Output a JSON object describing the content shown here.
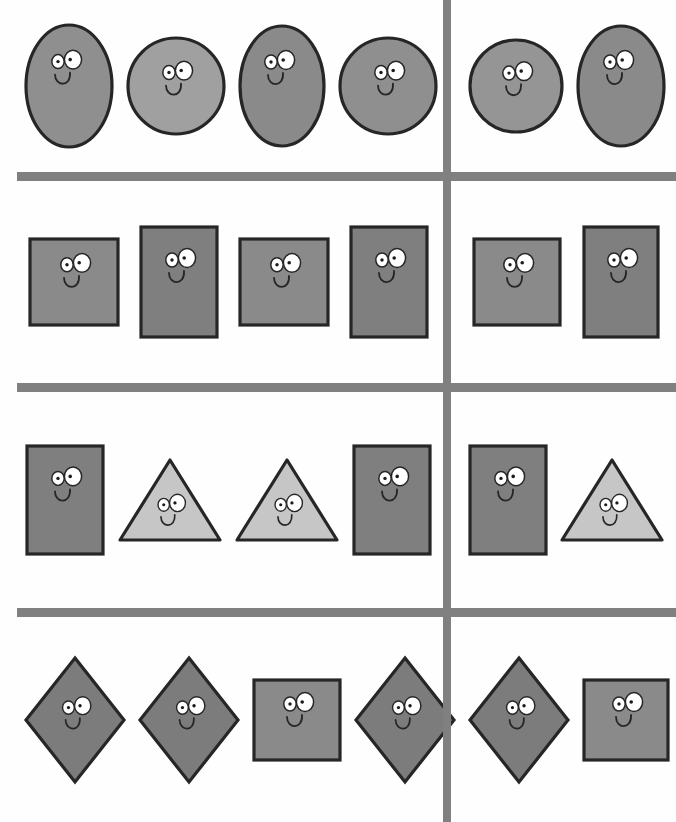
{
  "page": {
    "width": 676,
    "height": 822,
    "background_color": "#fefefe"
  },
  "colors": {
    "divider": "#808080",
    "outline": "#262626",
    "dark_gray_fill": "#7c7c7c",
    "mid_gray_fill": "#8f8f8f",
    "light_gray_fill": "#9a9a9a",
    "pale_gray_fill": "#c6c6c6",
    "eye_white": "#ffffff",
    "pupil": "#1a1a1a"
  },
  "dividers": {
    "vertical": {
      "x": 443,
      "y": 0,
      "width": 8,
      "height": 822
    },
    "horizontals": [
      {
        "x": 17,
        "y": 172,
        "width": 659,
        "height": 9
      },
      {
        "x": 17,
        "y": 383,
        "width": 659,
        "height": 9
      },
      {
        "x": 17,
        "y": 608,
        "width": 659,
        "height": 9
      }
    ]
  },
  "rows": [
    {
      "name": "row-ovals",
      "top": 0,
      "height": 172,
      "left_group": [
        {
          "shape": "oval",
          "label": "oval-tall",
          "w": 86,
          "h": 122,
          "fill": "#8f8f8f",
          "face": "left"
        },
        {
          "shape": "circle",
          "label": "circle",
          "w": 96,
          "h": 96,
          "fill": "#a0a0a0",
          "face": "center"
        },
        {
          "shape": "oval",
          "label": "oval-tall",
          "w": 84,
          "h": 120,
          "fill": "#8a8a8a",
          "face": "left"
        },
        {
          "shape": "circle",
          "label": "circle",
          "w": 96,
          "h": 96,
          "fill": "#8f8f8f",
          "face": "center"
        }
      ],
      "right_group": [
        {
          "shape": "circle",
          "label": "circle",
          "w": 92,
          "h": 92,
          "fill": "#959595",
          "face": "center"
        },
        {
          "shape": "oval",
          "label": "oval-tall",
          "w": 86,
          "h": 120,
          "fill": "#8a8a8a",
          "face": "left"
        }
      ]
    },
    {
      "name": "row-squares",
      "top": 181,
      "height": 202,
      "left_group": [
        {
          "shape": "rect",
          "label": "square",
          "w": 88,
          "h": 86,
          "fill": "#8a8a8a",
          "face": "center"
        },
        {
          "shape": "rect",
          "label": "rectangle-tall",
          "w": 76,
          "h": 110,
          "fill": "#7f7f7f",
          "face": "center"
        },
        {
          "shape": "rect",
          "label": "square",
          "w": 88,
          "h": 86,
          "fill": "#8a8a8a",
          "face": "center"
        },
        {
          "shape": "rect",
          "label": "rectangle-tall",
          "w": 76,
          "h": 110,
          "fill": "#7f7f7f",
          "face": "center"
        }
      ],
      "right_group": [
        {
          "shape": "rect",
          "label": "square",
          "w": 86,
          "h": 86,
          "fill": "#8a8a8a",
          "face": "center"
        },
        {
          "shape": "rect",
          "label": "rectangle-tall",
          "w": 74,
          "h": 110,
          "fill": "#7f7f7f",
          "face": "center"
        }
      ]
    },
    {
      "name": "row-triangles",
      "top": 392,
      "height": 216,
      "left_group": [
        {
          "shape": "rect",
          "label": "rectangle-tall",
          "w": 76,
          "h": 108,
          "fill": "#7f7f7f",
          "face": "center"
        },
        {
          "shape": "triangle",
          "label": "triangle",
          "w": 100,
          "h": 80,
          "fill": "#c6c6c6",
          "face": "center"
        },
        {
          "shape": "triangle",
          "label": "triangle",
          "w": 100,
          "h": 80,
          "fill": "#c6c6c6",
          "face": "center"
        },
        {
          "shape": "rect",
          "label": "rectangle-tall",
          "w": 76,
          "h": 108,
          "fill": "#7f7f7f",
          "face": "center"
        }
      ],
      "right_group": [
        {
          "shape": "rect",
          "label": "rectangle-tall",
          "w": 76,
          "h": 108,
          "fill": "#7f7f7f",
          "face": "center"
        },
        {
          "shape": "triangle",
          "label": "triangle",
          "w": 100,
          "h": 80,
          "fill": "#c6c6c6",
          "face": "center"
        }
      ]
    },
    {
      "name": "row-diamonds",
      "top": 617,
      "height": 205,
      "left_group": [
        {
          "shape": "diamond",
          "label": "diamond",
          "w": 98,
          "h": 124,
          "fill": "#7c7c7c",
          "face": "center"
        },
        {
          "shape": "diamond",
          "label": "diamond",
          "w": 98,
          "h": 124,
          "fill": "#7c7c7c",
          "face": "center"
        },
        {
          "shape": "rect",
          "label": "square",
          "w": 86,
          "h": 80,
          "fill": "#8a8a8a",
          "face": "center"
        },
        {
          "shape": "diamond",
          "label": "diamond",
          "w": 98,
          "h": 124,
          "fill": "#7c7c7c",
          "face": "center"
        }
      ],
      "right_group": [
        {
          "shape": "diamond",
          "label": "diamond",
          "w": 98,
          "h": 124,
          "fill": "#7c7c7c",
          "face": "center"
        },
        {
          "shape": "rect",
          "label": "square",
          "w": 84,
          "h": 80,
          "fill": "#8a8a8a",
          "face": "center"
        }
      ]
    }
  ]
}
